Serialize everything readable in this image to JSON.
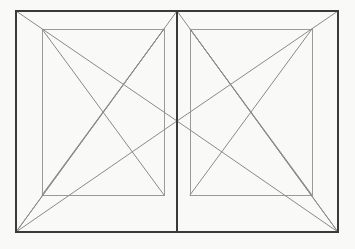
{
  "document": {
    "title": "Two-Panel Perspective Line Drawing",
    "background_color": "#f9f9f7",
    "width": 355,
    "height": 249
  },
  "style": {
    "outer_stroke_color": "#3a3a3a",
    "outer_stroke_width": 2,
    "divider_stroke_color": "#3a3a3a",
    "divider_stroke_width": 2,
    "inner_stroke_color": "#9a9a9a",
    "inner_stroke_width": 1,
    "diagonal_stroke_color": "#8a8a8a",
    "diagonal_stroke_width": 1
  },
  "geometry": {
    "outer_rect": {
      "name": "outer-frame",
      "x": 16,
      "y": 11,
      "width": 322,
      "height": 221
    },
    "divider": {
      "name": "center-divider",
      "x": 177,
      "y1": 11,
      "y2": 232
    },
    "center_point": {
      "name": "vanishing-point",
      "x": 177,
      "y": 121
    },
    "left_panel": {
      "name": "left-panel",
      "outer": {
        "x1": 16,
        "y1": 11,
        "x2": 177,
        "y2": 232
      },
      "inner_rect": {
        "x": 42,
        "y": 29,
        "width": 122,
        "height": 166
      },
      "inner_cross_point": {
        "x": 120,
        "y": 90
      }
    },
    "right_panel": {
      "name": "right-panel",
      "outer": {
        "x1": 177,
        "y1": 11,
        "x2": 338,
        "y2": 232
      },
      "inner_rect": {
        "x": 190,
        "y": 29,
        "width": 122,
        "height": 166
      },
      "inner_cross_point": {
        "x": 234,
        "y": 90
      }
    },
    "lines": [
      {
        "name": "left-inner-diagonal-tl-br",
        "x1": 42,
        "y1": 29,
        "x2": 164,
        "y2": 195
      },
      {
        "name": "left-inner-diagonal-bl-tr",
        "x1": 42,
        "y1": 195,
        "x2": 164,
        "y2": 29
      },
      {
        "name": "left-top-to-center",
        "x1": 16,
        "y1": 11,
        "x2": 177,
        "y2": 121
      },
      {
        "name": "left-bottomcorner-to-innertopright",
        "x1": 16,
        "y1": 232,
        "x2": 164,
        "y2": 29
      },
      {
        "name": "left-bottomcorner-to-center",
        "x1": 16,
        "y1": 232,
        "x2": 177,
        "y2": 121
      },
      {
        "name": "left-bottomcorner-to-divider-top",
        "x1": 16,
        "y1": 232,
        "x2": 177,
        "y2": 11
      },
      {
        "name": "right-inner-diagonal-tr-bl",
        "x1": 312,
        "y1": 29,
        "x2": 190,
        "y2": 195
      },
      {
        "name": "right-inner-diagonal-br-tl",
        "x1": 312,
        "y1": 195,
        "x2": 190,
        "y2": 29
      },
      {
        "name": "right-top-to-center",
        "x1": 338,
        "y1": 11,
        "x2": 177,
        "y2": 121
      },
      {
        "name": "right-bottomcorner-to-innertopleft",
        "x1": 338,
        "y1": 232,
        "x2": 190,
        "y2": 29
      },
      {
        "name": "right-bottomcorner-to-center",
        "x1": 338,
        "y1": 232,
        "x2": 177,
        "y2": 121
      },
      {
        "name": "right-bottomcorner-to-divider-top",
        "x1": 338,
        "y1": 232,
        "x2": 177,
        "y2": 11
      }
    ]
  }
}
